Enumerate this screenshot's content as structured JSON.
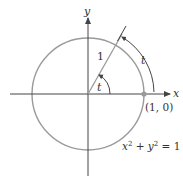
{
  "figure": {
    "axis_labels": {
      "x": "x",
      "y": "y"
    },
    "radius_label": "1",
    "angle_label": "t",
    "arc_length_label": "t",
    "point_label": "(1, 0)",
    "equation": {
      "part1": "x",
      "sup1": "2",
      "part2": " + y",
      "sup2": "2",
      "part3": " = 1"
    },
    "colors": {
      "circle": "#9a9a9a",
      "axes": "#444444",
      "point": "#9a9a9a",
      "text": "#333333"
    }
  }
}
